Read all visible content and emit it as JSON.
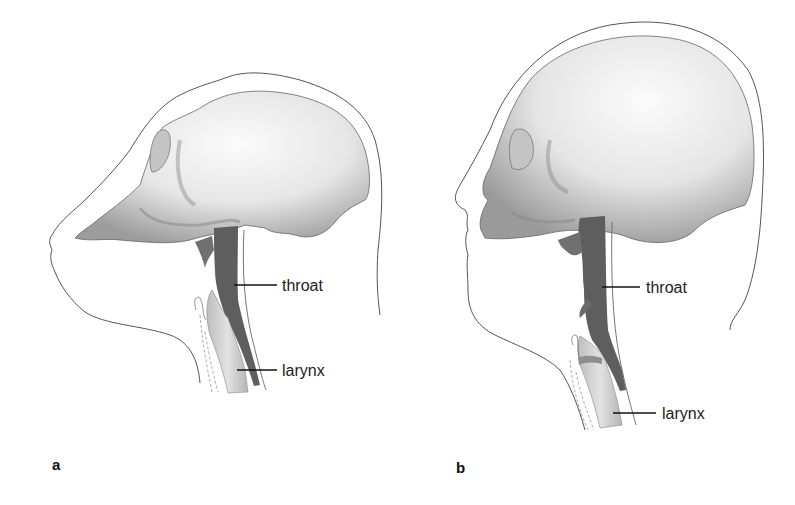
{
  "figure": {
    "panels": [
      {
        "id": "a",
        "letter": "a",
        "subject": "ape (chimpanzee) head, sagittal view",
        "labels": {
          "throat": "throat",
          "larynx": "larynx"
        }
      },
      {
        "id": "b",
        "letter": "b",
        "subject": "human head, sagittal view",
        "labels": {
          "throat": "throat",
          "larynx": "larynx"
        }
      }
    ],
    "colors": {
      "skull_light": "#f4f4f4",
      "skull_shadow": "#9a9a9a",
      "throat": "#5e5e5e",
      "larynx": "#cfcfcf",
      "outline": "#555555",
      "text": "#222222"
    }
  }
}
